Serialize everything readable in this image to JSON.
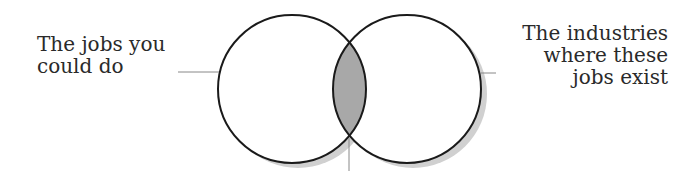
{
  "diagram": {
    "type": "venn",
    "left_set": {
      "lines": [
        "The jobs you",
        "could do"
      ]
    },
    "right_set": {
      "lines": [
        "The industries",
        "where these",
        "jobs exist"
      ]
    },
    "colors": {
      "outline": "#1a1a1a",
      "intersection_fill": "#a8a8a8",
      "shadow": "#d0d0d0",
      "background": "#ffffff",
      "text": "#2a2a2a"
    }
  }
}
